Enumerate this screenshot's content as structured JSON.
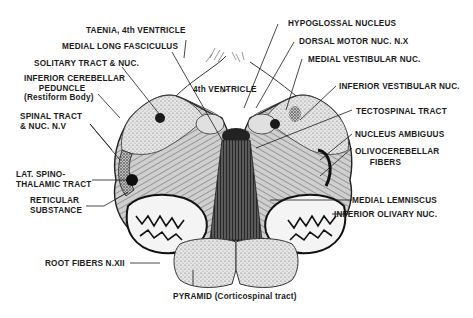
{
  "diagram": {
    "ink_color": "#1a1a1a",
    "background": "#ffffff",
    "labels_left": [
      {
        "id": "taenia",
        "text": "TAENIA, 4th VENTRICLE"
      },
      {
        "id": "mlf",
        "text": "MEDIAL LONG FASCICULUS"
      },
      {
        "id": "solitary",
        "text": "SOLITARY TRACT & NUC."
      },
      {
        "id": "icp",
        "text": "INFERIOR CEREBELLAR\n      PEDUNCLE\n(Restiform Body)"
      },
      {
        "id": "spinal5",
        "text": "SPINAL TRACT\n& NUC. N.V"
      },
      {
        "id": "lst",
        "text": "LAT. SPINO-\nTHALAMIC TRACT"
      },
      {
        "id": "reticular",
        "text": "RETICULAR\nSUBSTANCE"
      },
      {
        "id": "root12",
        "text": "ROOT FIBERS N.XII"
      }
    ],
    "labels_right": [
      {
        "id": "hypoglossal",
        "text": "HYPOGLOSSAL NUCLEUS"
      },
      {
        "id": "dmn",
        "text": "DORSAL MOTOR NUC. N.X"
      },
      {
        "id": "mvn",
        "text": "MEDIAL VESTIBULAR NUC."
      },
      {
        "id": "ivn",
        "text": "INFERIOR VESTIBULAR NUC."
      },
      {
        "id": "tecto",
        "text": "TECTOSPINAL TRACT"
      },
      {
        "id": "ambiguus",
        "text": "NUCLEUS AMBIGUUS"
      },
      {
        "id": "olivocereb",
        "text": "OLIVOCEREBELLAR\n      FIBERS"
      },
      {
        "id": "ml",
        "text": "MEDIAL LEMNISCUS"
      },
      {
        "id": "ion",
        "text": "INFERIOR OLIVARY NUC."
      }
    ],
    "labels_center": [
      {
        "id": "fourth",
        "text": "4th VENTRICLE"
      },
      {
        "id": "pyramid",
        "text": "PYRAMID (Corticospinal tract)"
      }
    ]
  }
}
